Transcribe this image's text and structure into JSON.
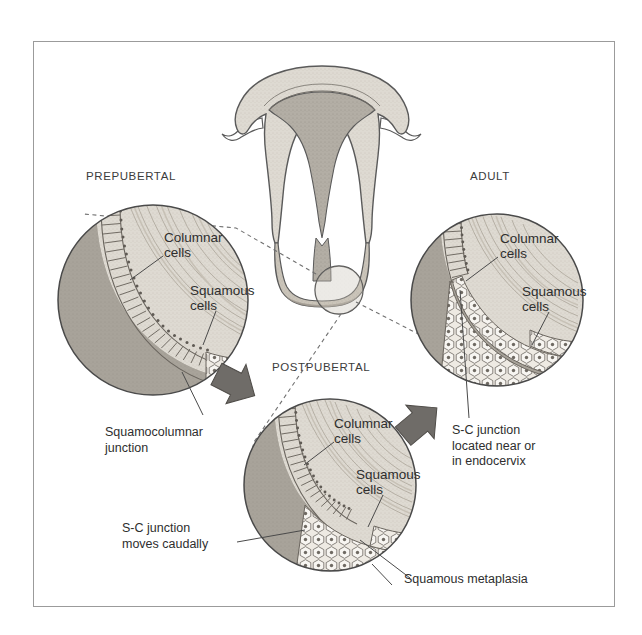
{
  "figure": {
    "domain": "medical-illustration",
    "title_visible": false,
    "frame": {
      "border_color": "#9b9b9b",
      "background": "#ffffff"
    }
  },
  "palette": {
    "outline": "#5a5a5a",
    "tissue_light": "#dedad2",
    "tissue_mid": "#c9c3b8",
    "tissue_dark": "#9a958c",
    "stroma_shadow": "#8e8a84",
    "canal_dark": "#8a8680",
    "cell_fill": "#f2efe9",
    "arrow_fill": "#6f6c68",
    "text": "#2e2e2e",
    "title_text": "#3c3c3c",
    "leader_line": "#555555",
    "dashed_line": "#707070"
  },
  "panels": [
    {
      "id": "prepubertal",
      "title": "PREPUBERTAL",
      "labels": [
        {
          "name": "columnar-cells",
          "text": "Columnar\ncells"
        },
        {
          "name": "squamous-cells",
          "text": "Squamous\ncells"
        }
      ]
    },
    {
      "id": "postpubertal",
      "title": "POSTPUBERTAL",
      "labels": [
        {
          "name": "columnar-cells",
          "text": "Columnar\ncells"
        },
        {
          "name": "squamous-cells",
          "text": "Squamous\ncells"
        }
      ]
    },
    {
      "id": "adult",
      "title": "ADULT",
      "labels": [
        {
          "name": "columnar-cells",
          "text": "Columnar\ncells"
        },
        {
          "name": "squamous-cells",
          "text": "Squamous\ncells"
        }
      ]
    }
  ],
  "annotations": [
    {
      "name": "squamocolumnar-junction",
      "text": "Squamocolumnar\njunction"
    },
    {
      "name": "sc-junction-endocervix",
      "text": "S-C junction\nlocated near or\nin endocervix"
    },
    {
      "name": "sc-junction-moves-caudally",
      "text": "S-C junction\nmoves caudally"
    },
    {
      "name": "squamous-metaplasia",
      "text": "Squamous metaplasia"
    }
  ],
  "arrows": [
    {
      "name": "arrow-prepubertal-to-postpubertal",
      "direction": "down-right"
    },
    {
      "name": "arrow-postpubertal-to-adult",
      "direction": "up-right"
    }
  ],
  "uterus": {
    "name": "uterus-cross-section",
    "features": [
      "fundus",
      "endometrial-cavity",
      "myometrium",
      "cervical-canal",
      "fallopian-tube-left",
      "fallopian-tube-right",
      "cervix-detail-circle"
    ]
  }
}
